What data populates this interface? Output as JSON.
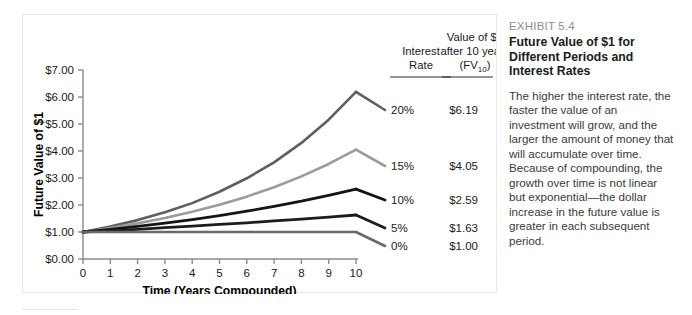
{
  "chart_data": {
    "type": "line",
    "title": "",
    "xlabel": "Time (Years Compounded)",
    "ylabel": "Future Value of $1",
    "xlim": [
      0,
      10
    ],
    "ylim": [
      0,
      7
    ],
    "grid": false,
    "legend_position": "right-of-plot",
    "x": [
      0,
      1,
      2,
      3,
      4,
      5,
      6,
      7,
      8,
      9,
      10
    ],
    "xtick_labels": [
      "0",
      "1",
      "2",
      "3",
      "4",
      "5",
      "6",
      "7",
      "8",
      "9",
      "10"
    ],
    "ytick_labels": [
      "$0.00",
      "$1.00",
      "$2.00",
      "$3.00",
      "$4.00",
      "$5.00",
      "$6.00",
      "$7.00"
    ],
    "ytick_values": [
      0,
      1,
      2,
      3,
      4,
      5,
      6,
      7
    ],
    "series": [
      {
        "name": "20%",
        "rate": 0.2,
        "color": "#5e5e5e",
        "width": 2.6,
        "end_label": "$6.19",
        "values": [
          1.0,
          1.2,
          1.44,
          1.73,
          2.07,
          2.49,
          2.99,
          3.58,
          4.3,
          5.16,
          6.19
        ]
      },
      {
        "name": "15%",
        "rate": 0.15,
        "color": "#9b9b9b",
        "width": 2.6,
        "end_label": "$4.05",
        "values": [
          1.0,
          1.15,
          1.32,
          1.52,
          1.75,
          2.01,
          2.31,
          2.66,
          3.06,
          3.52,
          4.05
        ]
      },
      {
        "name": "10%",
        "rate": 0.1,
        "color": "#141414",
        "width": 2.8,
        "end_label": "$2.59",
        "values": [
          1.0,
          1.1,
          1.21,
          1.33,
          1.46,
          1.61,
          1.77,
          1.95,
          2.14,
          2.36,
          2.59
        ]
      },
      {
        "name": "5%",
        "rate": 0.05,
        "color": "#1c1c1c",
        "width": 2.8,
        "end_label": "$1.63",
        "values": [
          1.0,
          1.05,
          1.1,
          1.16,
          1.22,
          1.28,
          1.34,
          1.41,
          1.48,
          1.55,
          1.63
        ]
      },
      {
        "name": "0%",
        "rate": 0.0,
        "color": "#6a6a6a",
        "width": 2.6,
        "end_label": "$1.00",
        "values": [
          1.0,
          1.0,
          1.0,
          1.0,
          1.0,
          1.0,
          1.0,
          1.0,
          1.0,
          1.0,
          1.0
        ]
      }
    ]
  },
  "legend_table": {
    "col1_header_line1": "Interest",
    "col1_header_line2": "Rate",
    "col2_header_line1": "Value of $1",
    "col2_header_line2": "after 10 years",
    "col2_header_line3_main": "(FV",
    "col2_header_line3_sub": "10",
    "col2_header_line3_tail": ")",
    "rows": [
      {
        "rate": "20%",
        "value": "$6.19"
      },
      {
        "rate": "15%",
        "value": "$4.05"
      },
      {
        "rate": "10%",
        "value": "$2.59"
      },
      {
        "rate": "5%",
        "value": "$1.63"
      },
      {
        "rate": "0%",
        "value": "$1.00"
      }
    ]
  },
  "exhibit": {
    "label": "EXHIBIT 5.4",
    "title": "Future Value of $1 for Different Periods and Interest Rates",
    "body": "The higher the interest rate, the faster the value of an investment will grow, and the larger the amount of money that will accumulate over time. Because of compounding, the growth over time is not linear but exponential—the dollar increase in the future value is greater in each subsequent period."
  },
  "colors": {
    "panel_border": "#e8e8e8",
    "divider": "#eaeaea",
    "axis": "#808080",
    "text": "#1a1a1a",
    "muted_text": "#8e8e8e"
  }
}
